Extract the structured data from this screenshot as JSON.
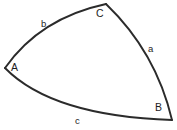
{
  "figure": {
    "type": "geometry-diagram",
    "background_color": "#ffffff",
    "stroke_color": "#2b2b2b",
    "text_color": "#1e1e1e"
  },
  "vertices": [
    {
      "id": "A",
      "label": "A",
      "x": 5,
      "y": 68
    },
    {
      "id": "B",
      "label": "B",
      "x": 172,
      "y": 120
    },
    {
      "id": "C",
      "label": "C",
      "x": 106,
      "y": 4
    }
  ],
  "sides": [
    {
      "id": "a",
      "label": "a",
      "from": "C",
      "to": "B"
    },
    {
      "id": "b",
      "label": "b",
      "from": "A",
      "to": "C"
    },
    {
      "id": "c",
      "label": "c",
      "from": "A",
      "to": "B"
    }
  ],
  "paths": {
    "arc_b": "M 5 68 Q 40 18 106 4",
    "arc_a": "M 106 4 Q 156 52 172 120",
    "arc_c": "M 5 68 Q 52 116 172 120"
  }
}
